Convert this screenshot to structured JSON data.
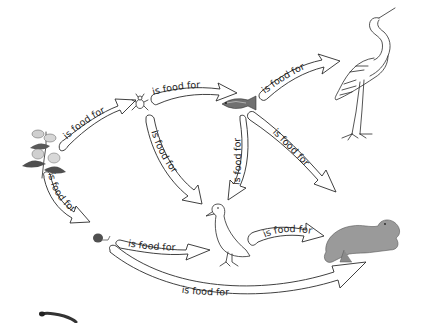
{
  "diagram": {
    "type": "food-web",
    "organisms": [
      {
        "id": "plant",
        "name": "plant"
      },
      {
        "id": "insect",
        "name": "insect"
      },
      {
        "id": "fish",
        "name": "fish"
      },
      {
        "id": "heron",
        "name": "heron"
      },
      {
        "id": "snail",
        "name": "snail"
      },
      {
        "id": "duck",
        "name": "duck"
      },
      {
        "id": "otter",
        "name": "otter"
      },
      {
        "id": "worm",
        "name": "worm"
      }
    ],
    "relations": [
      {
        "from": "plant",
        "to": "insect",
        "label": "is food for"
      },
      {
        "from": "insect",
        "to": "fish",
        "label": "is food for"
      },
      {
        "from": "fish",
        "to": "heron",
        "label": "is food for"
      },
      {
        "from": "insect",
        "to": "duck",
        "label": "is food for"
      },
      {
        "from": "fish",
        "to": "duck",
        "label": "is food for"
      },
      {
        "from": "fish",
        "to": "otter",
        "label": "is food for"
      },
      {
        "from": "plant",
        "to": "snail",
        "label": "is food for"
      },
      {
        "from": "snail",
        "to": "duck",
        "label": "is food for"
      },
      {
        "from": "duck",
        "to": "otter",
        "label": "is food for"
      },
      {
        "from": "snail",
        "to": "otter",
        "label": "is food for"
      }
    ],
    "colors": {
      "background": "#ffffff",
      "outline": "#2b2b2b",
      "otter_fill": "#9a9a9a",
      "fish_fill": "#6e6e6e",
      "plant_leaf": "#555555"
    }
  }
}
